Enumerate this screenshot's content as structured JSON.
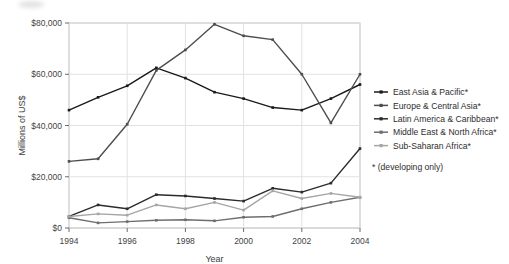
{
  "chart_data": {
    "type": "line",
    "title": "",
    "xlabel": "Year",
    "ylabel": "Millions of US$",
    "x": [
      1994,
      1995,
      1996,
      1997,
      1998,
      1999,
      2000,
      2001,
      2002,
      2003,
      2004
    ],
    "xlim": [
      1994,
      2004
    ],
    "ylim": [
      0,
      80000
    ],
    "xticks": [
      1994,
      1996,
      1998,
      2000,
      2002,
      2004
    ],
    "xticklabels": [
      "1994",
      "1996",
      "1998",
      "2000",
      "2002",
      "2004"
    ],
    "yticks": [
      0,
      20000,
      40000,
      60000,
      80000
    ],
    "yticklabels": [
      "$0",
      "$20,000",
      "$40,000",
      "$60,000",
      "$80,000"
    ],
    "grid": true,
    "legend_position": "right",
    "legend_note": "* (developing only)",
    "series": [
      {
        "name": "East Asia & Pacific*",
        "color": "#1a1a1a",
        "values": [
          46000,
          51000,
          55500,
          62500,
          58500,
          53000,
          50500,
          47000,
          46000,
          50500,
          56000
        ]
      },
      {
        "name": "Europe & Central Asia*",
        "color": "#4d4d4d",
        "values": [
          26000,
          27000,
          40500,
          61500,
          69500,
          79500,
          75000,
          73500,
          60000,
          41000,
          60000
        ]
      },
      {
        "name": "Latin America & Caribbean*",
        "color": "#2b2b2b",
        "values": [
          4500,
          9000,
          7500,
          13000,
          12500,
          11500,
          10500,
          15500,
          14000,
          17500,
          31000
        ]
      },
      {
        "name": "Middle East & North Africa*",
        "color": "#6e6e6e",
        "values": [
          4000,
          2000,
          2500,
          3000,
          3200,
          2800,
          4200,
          4500,
          7500,
          10000,
          12000
        ]
      },
      {
        "name": "Sub-Saharan Africa*",
        "color": "#a6a6a6",
        "values": [
          4500,
          5500,
          5000,
          9000,
          7500,
          10000,
          7000,
          14500,
          11500,
          13500,
          12000
        ]
      }
    ]
  }
}
